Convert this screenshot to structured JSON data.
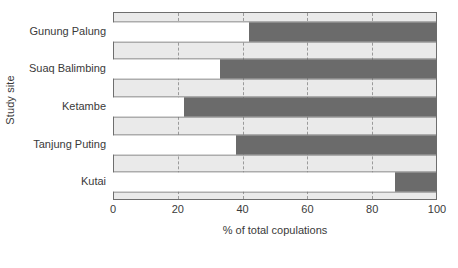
{
  "chart_data": {
    "type": "bar",
    "orientation": "horizontal",
    "stacked": true,
    "title": "",
    "xlabel": "% of total copulations",
    "ylabel": "Study site",
    "categories": [
      "Gunung Palung",
      "Suaq Balimbing",
      "Ketambe",
      "Tanjung Puting",
      "Kutai"
    ],
    "series": [
      {
        "name": "segment-white",
        "values": [
          42,
          33,
          22,
          38,
          87
        ]
      },
      {
        "name": "segment-dark",
        "values": [
          58,
          67,
          78,
          62,
          13
        ]
      }
    ],
    "xlim": [
      0,
      100
    ],
    "xticks": [
      0,
      20,
      40,
      60,
      80,
      100
    ],
    "xtick_labels": [
      "0",
      "20",
      "40",
      "60",
      "80",
      "100"
    ],
    "gridlines": {
      "vertical": true,
      "style": "dashed",
      "at": [
        20,
        40,
        60,
        80
      ]
    },
    "legend": "none",
    "colors": {
      "segment_white": "#ffffff",
      "segment_dark": "#6b6b6b",
      "plot_background": "#eaeaea",
      "axis_line": "#6e6e6e",
      "gridline": "#9a9a9a",
      "text": "#3a3a3a"
    }
  }
}
